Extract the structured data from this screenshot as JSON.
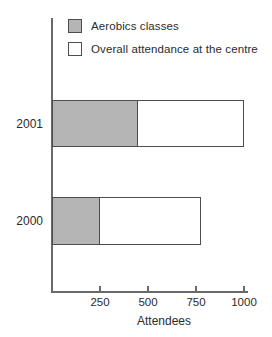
{
  "chart_data": {
    "type": "bar",
    "orientation": "horizontal",
    "categories": [
      "2001",
      "2000"
    ],
    "series": [
      {
        "name": "Aerobics classes",
        "values": [
          450,
          250
        ]
      },
      {
        "name": "Overall attendance at the centre",
        "values": [
          1000,
          775
        ]
      }
    ],
    "xlabel": "Attendees",
    "xticks": [
      250,
      500,
      750,
      1000
    ],
    "xtick_labels": [
      "250",
      "500",
      "750",
      "1000"
    ],
    "xlim": [
      0,
      1000
    ],
    "legend_position": "top-left",
    "grid": false,
    "style_note": "Aerobics classes drawn as shaded segment overlapping left part of overall attendance bar"
  },
  "colors": {
    "aerobics_fill": "#b5b5b5",
    "overall_fill": "#ffffff",
    "bar_border": "#4d4d4d",
    "axis": "#6a6a6a",
    "text": "#2b2b2b",
    "background": "#ffffff"
  }
}
